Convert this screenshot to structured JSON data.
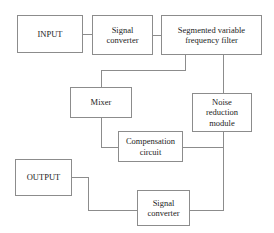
{
  "diagram": {
    "type": "block-diagram",
    "canvas": {
      "width": 274,
      "height": 233
    },
    "style": {
      "background_color": "#ffffff",
      "box_border_color": "#8c8c8c",
      "connector_color": "#8c8c8c",
      "text_color": "#1c1c1c"
    },
    "nodes": [
      {
        "id": "input",
        "label": "INPUT",
        "x": 17,
        "y": 15,
        "width": 66,
        "height": 38,
        "font_size": 8.5
      },
      {
        "id": "signal-converter-top",
        "label": "Signal\nconverter",
        "x": 92,
        "y": 15,
        "width": 61,
        "height": 40,
        "font_size": 8.5
      },
      {
        "id": "segmented-variable-frequency-filter",
        "label": "Segmented variable\nfrequency filter",
        "x": 161,
        "y": 15,
        "width": 101,
        "height": 40,
        "font_size": 8.5
      },
      {
        "id": "mixer",
        "label": "Mixer",
        "x": 70,
        "y": 87,
        "width": 62,
        "height": 31,
        "font_size": 8.5
      },
      {
        "id": "noise-reduction-module",
        "label": "Noise\nreduction\nmodule",
        "x": 192,
        "y": 93,
        "width": 60,
        "height": 39,
        "font_size": 8.5
      },
      {
        "id": "compensation-circuit",
        "label": "Compensation\ncircuit",
        "x": 118,
        "y": 131,
        "width": 65,
        "height": 31,
        "font_size": 8.5
      },
      {
        "id": "output",
        "label": "OUTPUT",
        "x": 15,
        "y": 159,
        "width": 57,
        "height": 37,
        "font_size": 8.5
      },
      {
        "id": "signal-converter-bottom",
        "label": "Signal\nconverter",
        "x": 137,
        "y": 190,
        "width": 53,
        "height": 36,
        "font_size": 8.5
      }
    ],
    "connectors": [
      {
        "id": "input-to-signal-converter-top",
        "from": "input",
        "to": "signal-converter-top",
        "points": "83,34 92,34"
      },
      {
        "id": "signal-converter-top-to-filter",
        "from": "signal-converter-top",
        "to": "segmented-variable-frequency-filter",
        "points": "153,35 161,35"
      },
      {
        "id": "filter-to-mixer",
        "from": "segmented-variable-frequency-filter",
        "to": "mixer",
        "points": "185,55 185,70 101,70 101,87"
      },
      {
        "id": "filter-to-noise-reduction-module",
        "from": "segmented-variable-frequency-filter",
        "to": "noise-reduction-module",
        "points": "223,55 223,93"
      },
      {
        "id": "mixer-to-compensation-circuit",
        "from": "mixer",
        "to": "compensation-circuit",
        "points": "101,118 101,147 118,147"
      },
      {
        "id": "noise-reduction-module-to-bus",
        "from": "noise-reduction-module",
        "to": "signal-converter-bottom",
        "points": "223,132 223,210 190,210"
      },
      {
        "id": "compensation-circuit-to-bus",
        "from": "compensation-circuit",
        "to": "noise-reduction-module",
        "points": "183,147 223,147"
      },
      {
        "id": "output-to-signal-converter-bottom",
        "from": "signal-converter-bottom",
        "to": "output",
        "points": "72,177 88,177 88,210 137,210"
      }
    ]
  }
}
